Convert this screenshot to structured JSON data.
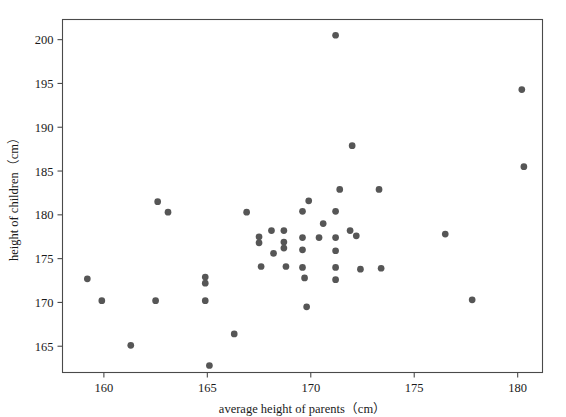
{
  "chart_data": {
    "type": "scatter",
    "title": "",
    "xlabel": "average height of parents（cm）",
    "ylabel": "height of children（cm）",
    "xlim": [
      158.0,
      181.2
    ],
    "ylim": [
      162.0,
      202.3
    ],
    "xticks": [
      160,
      165,
      170,
      175,
      180
    ],
    "xticklabels": [
      "160",
      "165",
      "170",
      "175",
      "180"
    ],
    "yticks": [
      165,
      170,
      175,
      180,
      185,
      190,
      195,
      200
    ],
    "yticklabels": [
      "165",
      "170",
      "175",
      "180",
      "185",
      "190",
      "195",
      "200"
    ],
    "grid": false,
    "legend": null,
    "marker": "circle",
    "marker_color": "#565656",
    "marker_size": 5.2,
    "points": [
      {
        "x": 159.2,
        "y": 172.7
      },
      {
        "x": 159.9,
        "y": 170.2
      },
      {
        "x": 161.3,
        "y": 165.1
      },
      {
        "x": 162.6,
        "y": 181.5
      },
      {
        "x": 162.5,
        "y": 170.2
      },
      {
        "x": 163.1,
        "y": 180.3
      },
      {
        "x": 164.9,
        "y": 172.9
      },
      {
        "x": 164.9,
        "y": 172.2
      },
      {
        "x": 164.9,
        "y": 170.2
      },
      {
        "x": 165.1,
        "y": 162.8
      },
      {
        "x": 166.3,
        "y": 166.4
      },
      {
        "x": 166.9,
        "y": 180.3
      },
      {
        "x": 167.5,
        "y": 177.5
      },
      {
        "x": 167.5,
        "y": 176.8
      },
      {
        "x": 167.6,
        "y": 174.1
      },
      {
        "x": 168.1,
        "y": 178.2
      },
      {
        "x": 168.2,
        "y": 175.6
      },
      {
        "x": 168.7,
        "y": 178.2
      },
      {
        "x": 168.7,
        "y": 176.9
      },
      {
        "x": 168.7,
        "y": 176.2
      },
      {
        "x": 168.8,
        "y": 174.1
      },
      {
        "x": 169.6,
        "y": 180.4
      },
      {
        "x": 169.6,
        "y": 177.4
      },
      {
        "x": 169.6,
        "y": 176.0
      },
      {
        "x": 169.6,
        "y": 174.0
      },
      {
        "x": 169.7,
        "y": 172.8
      },
      {
        "x": 169.8,
        "y": 169.5
      },
      {
        "x": 169.9,
        "y": 181.6
      },
      {
        "x": 170.4,
        "y": 177.4
      },
      {
        "x": 170.6,
        "y": 179.0
      },
      {
        "x": 171.2,
        "y": 200.5
      },
      {
        "x": 171.2,
        "y": 180.4
      },
      {
        "x": 171.2,
        "y": 177.4
      },
      {
        "x": 171.2,
        "y": 175.9
      },
      {
        "x": 171.2,
        "y": 174.0
      },
      {
        "x": 171.2,
        "y": 172.6
      },
      {
        "x": 171.4,
        "y": 182.9
      },
      {
        "x": 171.9,
        "y": 178.2
      },
      {
        "x": 172.0,
        "y": 187.9
      },
      {
        "x": 172.2,
        "y": 177.6
      },
      {
        "x": 172.4,
        "y": 173.8
      },
      {
        "x": 173.3,
        "y": 182.9
      },
      {
        "x": 173.4,
        "y": 173.9
      },
      {
        "x": 176.5,
        "y": 177.8
      },
      {
        "x": 177.8,
        "y": 170.3
      },
      {
        "x": 180.2,
        "y": 194.3
      },
      {
        "x": 180.3,
        "y": 185.5
      }
    ]
  },
  "axis": {
    "x_title": "average height of parents（cm）",
    "y_title": "height of children（cm）"
  }
}
